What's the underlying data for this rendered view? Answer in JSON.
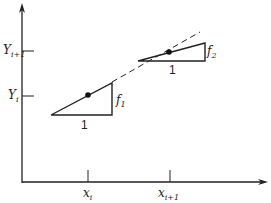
{
  "diagram": {
    "y_axis_labels": {
      "y_i_plus_1": {
        "base": "Y",
        "sub": "i+1"
      },
      "y_i": {
        "base": "Y",
        "sub": "i"
      }
    },
    "x_axis_labels": {
      "x_i": {
        "base": "x",
        "sub": "i"
      },
      "x_i_plus_1": {
        "base": "x",
        "sub": "i+1"
      }
    },
    "triangle_1": {
      "run_label": "1",
      "rise_label": {
        "base": "f",
        "sub": "1"
      }
    },
    "triangle_2": {
      "run_label": "1",
      "rise_label": {
        "base": "f",
        "sub": "2"
      }
    },
    "colors": {
      "line": "#222222",
      "background": "#ffffff"
    }
  }
}
